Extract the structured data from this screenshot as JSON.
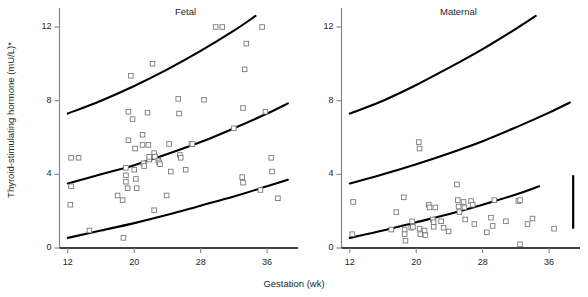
{
  "figure": {
    "ylabel": "Thyroid-stimulating hormone (mU/L)*",
    "xlabel": "Gestation (wk)"
  },
  "chart_data": {
    "type": "scatter",
    "title": "",
    "xlabel": "Gestation (wk)",
    "ylabel": "Thyroid-stimulating hormone (mU/L)*",
    "xlim": [
      11,
      39
    ],
    "ylim": [
      0,
      13
    ],
    "xticks": [
      12,
      20,
      28,
      36
    ],
    "yticks": [
      0,
      4,
      8,
      12
    ],
    "grid": false,
    "legend": null,
    "panels": [
      {
        "name": "fetal",
        "label": "Fetal",
        "reference_curves": [
          {
            "name": "upper-centile",
            "points": [
              [
                12,
                7.3
              ],
              [
                16,
                8.0
              ],
              [
                20,
                8.8
              ],
              [
                24,
                9.7
              ],
              [
                28,
                10.7
              ],
              [
                32,
                11.8
              ],
              [
                34.6,
                12.6
              ]
            ]
          },
          {
            "name": "median-centile",
            "points": [
              [
                12,
                3.5
              ],
              [
                16,
                4.0
              ],
              [
                20,
                4.5
              ],
              [
                24,
                5.1
              ],
              [
                28,
                5.75
              ],
              [
                32,
                6.5
              ],
              [
                36,
                7.3
              ],
              [
                38.5,
                7.85
              ]
            ]
          },
          {
            "name": "lower-centile",
            "points": [
              [
                12,
                0.55
              ],
              [
                16,
                0.95
              ],
              [
                20,
                1.35
              ],
              [
                24,
                1.8
              ],
              [
                28,
                2.3
              ],
              [
                32,
                2.8
              ],
              [
                36,
                3.35
              ],
              [
                38.5,
                3.7
              ]
            ]
          }
        ],
        "points": [
          [
            12.4,
            4.9
          ],
          [
            13.3,
            4.9
          ],
          [
            12.4,
            3.35
          ],
          [
            12.3,
            2.35
          ],
          [
            14.6,
            0.95
          ],
          [
            18.0,
            2.85
          ],
          [
            18.6,
            2.6
          ],
          [
            18.7,
            0.55
          ],
          [
            19.0,
            4.35
          ],
          [
            19.0,
            3.95
          ],
          [
            19.0,
            3.6
          ],
          [
            19.2,
            3.25
          ],
          [
            19.3,
            7.4
          ],
          [
            19.6,
            9.35
          ],
          [
            19.8,
            7.0
          ],
          [
            19.3,
            5.85
          ],
          [
            20.1,
            5.4
          ],
          [
            20.0,
            4.25
          ],
          [
            20.2,
            3.75
          ],
          [
            20.3,
            3.25
          ],
          [
            21.0,
            6.15
          ],
          [
            21.0,
            5.6
          ],
          [
            21.1,
            4.6
          ],
          [
            21.2,
            4.45
          ],
          [
            21.6,
            7.35
          ],
          [
            21.7,
            5.6
          ],
          [
            21.8,
            4.8
          ],
          [
            21.8,
            4.95
          ],
          [
            22.2,
            10.0
          ],
          [
            22.4,
            5.15
          ],
          [
            22.5,
            4.95
          ],
          [
            22.4,
            2.05
          ],
          [
            22.9,
            4.75
          ],
          [
            23.0,
            4.65
          ],
          [
            23.1,
            4.55
          ],
          [
            23.9,
            2.85
          ],
          [
            24.2,
            5.65
          ],
          [
            24.4,
            4.15
          ],
          [
            25.3,
            8.1
          ],
          [
            25.4,
            7.3
          ],
          [
            25.5,
            5.05
          ],
          [
            25.6,
            4.9
          ],
          [
            26.2,
            4.25
          ],
          [
            26.9,
            5.65
          ],
          [
            27.0,
            5.65
          ],
          [
            28.4,
            8.05
          ],
          [
            29.8,
            12.0
          ],
          [
            30.6,
            12.0
          ],
          [
            32.0,
            6.5
          ],
          [
            33.1,
            7.6
          ],
          [
            33.3,
            9.7
          ],
          [
            33.5,
            11.1
          ],
          [
            33.0,
            3.85
          ],
          [
            33.1,
            3.55
          ],
          [
            35.4,
            12.0
          ],
          [
            35.8,
            7.4
          ],
          [
            35.2,
            3.15
          ],
          [
            36.5,
            4.9
          ],
          [
            36.6,
            4.15
          ],
          [
            37.3,
            2.7
          ]
        ]
      },
      {
        "name": "maternal",
        "label": "Maternal",
        "reference_curves": [
          {
            "name": "upper-centile",
            "points": [
              [
                12,
                7.3
              ],
              [
                16,
                8.0
              ],
              [
                20,
                8.85
              ],
              [
                24,
                9.8
              ],
              [
                28,
                10.8
              ],
              [
                32,
                11.9
              ],
              [
                34.4,
                12.6
              ]
            ]
          },
          {
            "name": "median-centile",
            "points": [
              [
                12,
                3.5
              ],
              [
                16,
                4.0
              ],
              [
                20,
                4.55
              ],
              [
                24,
                5.15
              ],
              [
                28,
                5.8
              ],
              [
                32,
                6.55
              ],
              [
                36,
                7.35
              ],
              [
                38.5,
                7.9
              ]
            ]
          },
          {
            "name": "lower-centile",
            "points": [
              [
                12,
                0.55
              ],
              [
                16,
                0.95
              ],
              [
                20,
                1.4
              ],
              [
                24,
                1.85
              ],
              [
                28,
                2.35
              ],
              [
                32,
                2.9
              ],
              [
                34.8,
                3.35
              ]
            ]
          }
        ],
        "points": [
          [
            12.4,
            2.5
          ],
          [
            12.3,
            0.75
          ],
          [
            17.0,
            1.0
          ],
          [
            17.6,
            1.95
          ],
          [
            18.5,
            2.75
          ],
          [
            18.6,
            1.0
          ],
          [
            18.6,
            0.75
          ],
          [
            18.7,
            0.4
          ],
          [
            19.4,
            1.1
          ],
          [
            19.5,
            1.45
          ],
          [
            19.6,
            1.15
          ],
          [
            20.3,
            5.75
          ],
          [
            20.4,
            5.4
          ],
          [
            20.4,
            1.05
          ],
          [
            20.5,
            0.75
          ],
          [
            21.0,
            0.95
          ],
          [
            21.1,
            0.7
          ],
          [
            21.5,
            2.35
          ],
          [
            21.6,
            2.2
          ],
          [
            22.0,
            1.55
          ],
          [
            22.1,
            1.4
          ],
          [
            22.1,
            1.15
          ],
          [
            22.3,
            2.2
          ],
          [
            23.0,
            1.45
          ],
          [
            23.3,
            1.1
          ],
          [
            23.9,
            0.9
          ],
          [
            24.9,
            3.45
          ],
          [
            25.0,
            2.6
          ],
          [
            25.1,
            2.25
          ],
          [
            25.2,
            1.95
          ],
          [
            25.7,
            2.5
          ],
          [
            25.8,
            2.2
          ],
          [
            25.9,
            1.55
          ],
          [
            26.6,
            2.55
          ],
          [
            26.8,
            2.35
          ],
          [
            27.0,
            1.3
          ],
          [
            28.5,
            0.85
          ],
          [
            29.0,
            1.65
          ],
          [
            29.2,
            1.2
          ],
          [
            29.4,
            2.6
          ],
          [
            30.8,
            1.45
          ],
          [
            32.3,
            2.55
          ],
          [
            32.5,
            2.6
          ],
          [
            32.5,
            0.2
          ],
          [
            33.4,
            1.3
          ],
          [
            34.0,
            1.6
          ],
          [
            36.6,
            1.05
          ]
        ]
      }
    ],
    "annotations": [
      {
        "name": "scale-bar",
        "type": "vertical-bar",
        "x": 38.9,
        "y0": 1.05,
        "y1": 3.95
      }
    ]
  }
}
